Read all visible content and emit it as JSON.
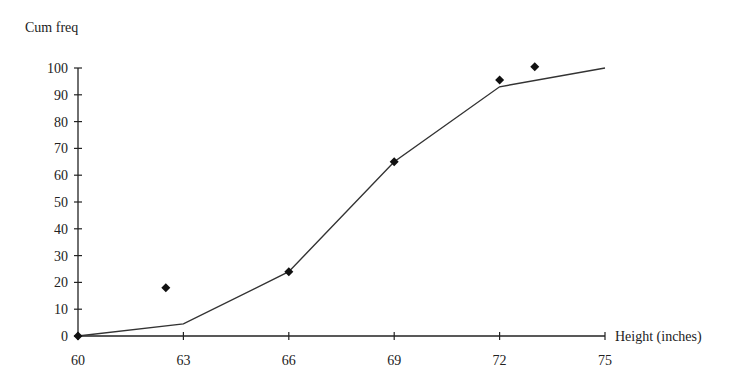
{
  "chart_data": {
    "type": "line",
    "title": "",
    "ylabel": "Cum freq",
    "xlabel": "Height (inches)",
    "xlim": [
      60,
      75
    ],
    "ylim": [
      0,
      100
    ],
    "x_ticks": [
      60,
      63,
      66,
      69,
      72,
      75
    ],
    "y_ticks": [
      0,
      10,
      20,
      30,
      40,
      50,
      60,
      70,
      80,
      90,
      100
    ],
    "grid": false,
    "legend": null,
    "series": [
      {
        "name": "Cumulative frequency polygon",
        "kind": "line",
        "points": [
          [
            60,
            0
          ],
          [
            63,
            4.5
          ],
          [
            66,
            24
          ],
          [
            69,
            65
          ],
          [
            72,
            93
          ],
          [
            75,
            100
          ]
        ]
      },
      {
        "name": "Cumulative frequency points",
        "kind": "scatter",
        "marker": "diamond",
        "points": [
          [
            60,
            0
          ],
          [
            62.5,
            18
          ],
          [
            66,
            24
          ],
          [
            69,
            65
          ],
          [
            72,
            95.5
          ],
          [
            73,
            100.5
          ]
        ]
      }
    ]
  },
  "colors": {
    "axis": "#222222",
    "line": "#333333",
    "marker": "#111111",
    "background": "#ffffff"
  }
}
